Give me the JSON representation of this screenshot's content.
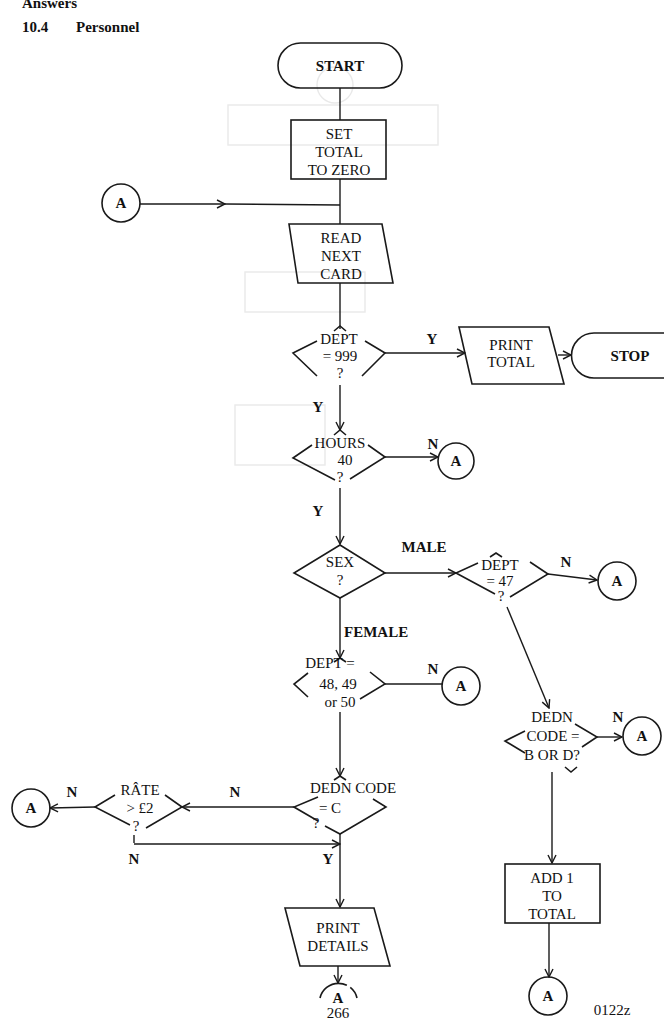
{
  "header": {
    "section_number": "10.4",
    "section_title": "Personnel",
    "top_fragment": "Answers"
  },
  "footer": {
    "page_number": "266",
    "figure_code": "0122z"
  },
  "flowchart": {
    "terminals": {
      "start": "START",
      "stop": "STOP"
    },
    "processes": {
      "set_total": [
        "SET",
        "TOTAL",
        "TO ZERO"
      ],
      "add_total": [
        "ADD 1",
        "TO",
        "TOTAL"
      ]
    },
    "io": {
      "read_card": [
        "READ",
        "NEXT",
        "CARD"
      ],
      "print_total": [
        "PRINT",
        "TOTAL"
      ],
      "print_details": [
        "PRINT",
        "DETAILS"
      ]
    },
    "decisions": {
      "dept_999": [
        "DEPT",
        "=  999",
        "?"
      ],
      "hours_40": [
        "HOURS",
        "40",
        "?"
      ],
      "sex": [
        "SEX",
        "?"
      ],
      "dept_47": [
        "DEPT",
        "=  47",
        "?"
      ],
      "dept_48": [
        "DEPT  =",
        "48, 49",
        "or 50"
      ],
      "dedn_bd": [
        "DEDN",
        "CODE =",
        "B OR D?"
      ],
      "dedn_c": [
        "DEDN CODE",
        "=   C",
        "?"
      ],
      "rate": [
        "RÂTE",
        "> £2",
        "?"
      ]
    },
    "connector_label": "A",
    "branch_labels": {
      "dept999_yes": "Y",
      "dept999_down": "Y",
      "hours_no": "N",
      "hours_down": "Y",
      "male": "MALE",
      "female": "FEMALE",
      "dept47_no": "N",
      "dept48_no": "N",
      "dedn_bd_no": "N",
      "dedn_c_no": "N",
      "rate_no": "N",
      "rate_down": "N",
      "dedn_c_yes": "Y"
    }
  }
}
